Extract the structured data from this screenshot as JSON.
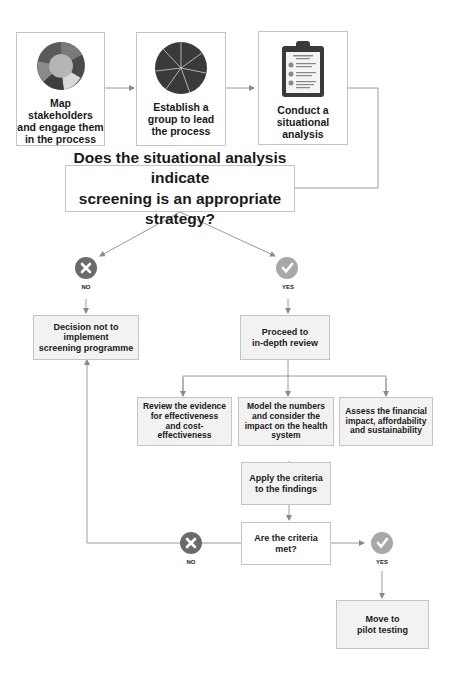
{
  "flow": {
    "top": [
      {
        "label": "Map stakeholders\nand engage them\nin the process",
        "icon": "puzzle-ring-icon"
      },
      {
        "label": "Establish a\ngroup to lead\nthe process",
        "icon": "puzzle-circle-icon"
      },
      {
        "label": "Conduct a\nsituational\nanalysis",
        "icon": "clipboard-checklist-icon"
      }
    ],
    "question": "Does the situational analysis indicate\nscreening is an appropriate strategy?",
    "no_label": "NO",
    "yes_label": "YES",
    "decision_no": "Decision not to\nimplement\nscreening programme",
    "proceed": "Proceed to\nin-depth review",
    "review": [
      "Review the evidence\nfor effectiveness\nand cost-\neffectiveness",
      "Model the numbers\nand consider the\nimpact on the health\nsystem",
      "Assess the financial\nimpact, affordability\nand sustainability"
    ],
    "apply": "Apply the criteria\nto the findings",
    "criteria_q": "Are the criteria\nmet?",
    "no_label2": "NO",
    "yes_label2": "YES",
    "pilot": "Move to\npilot testing"
  },
  "colors": {
    "no_badge": "#6b6b6b",
    "yes_badge": "#a8a8a8",
    "line": "#9a9a9a",
    "box_border": "#c4c4c4"
  }
}
